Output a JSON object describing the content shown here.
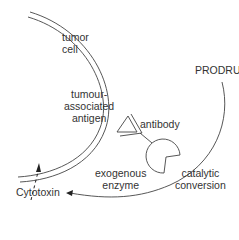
{
  "diagram": {
    "type": "ADEPT mechanism schematic",
    "labels": {
      "tumor_cell": [
        "tumor",
        "cell"
      ],
      "antigen": [
        "tumour-",
        "associated",
        "antigen"
      ],
      "antibody": "antibody",
      "prodrug": "PRODRUG",
      "enzyme": [
        "exogenous",
        "enzyme"
      ],
      "conversion": [
        "catalytic",
        "conversion"
      ],
      "cytotoxin": "Cytotoxin"
    },
    "colors": {
      "stroke": "#444444",
      "text": "#333333",
      "background": "#ffffff"
    }
  }
}
